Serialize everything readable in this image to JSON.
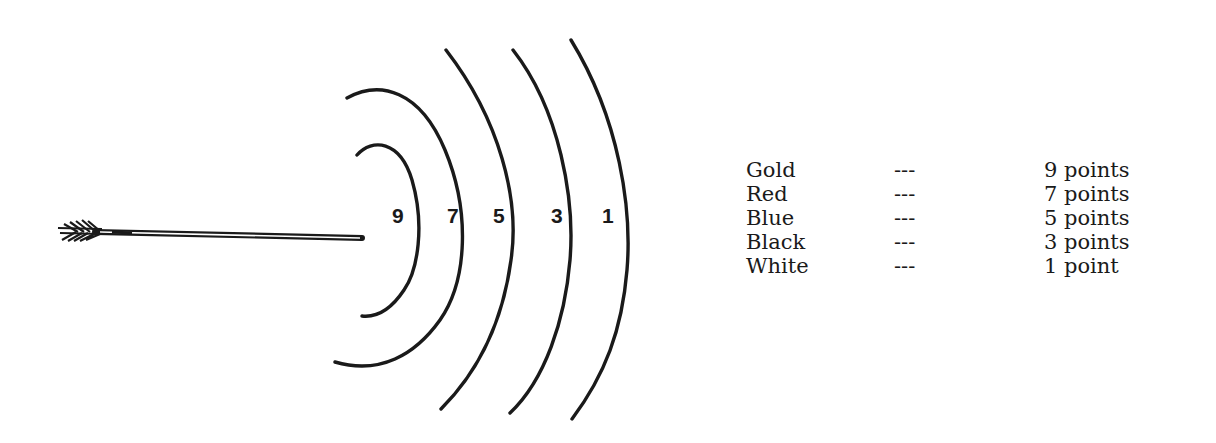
{
  "diagram": {
    "arrow": {
      "icon": "arrow-icon"
    },
    "rings": [
      {
        "label": "9",
        "x": 398,
        "y": 219
      },
      {
        "label": "7",
        "x": 454,
        "y": 219
      },
      {
        "label": "5",
        "x": 500,
        "y": 219
      },
      {
        "label": "3",
        "x": 558,
        "y": 219
      },
      {
        "label": "1",
        "x": 610,
        "y": 219
      }
    ],
    "ink_color": "#1a1a1a"
  },
  "legend": {
    "rows": [
      {
        "color": "Gold",
        "separator": "---",
        "points": "9 points"
      },
      {
        "color": "Red",
        "separator": "---",
        "points": "7 points"
      },
      {
        "color": "Blue",
        "separator": "---",
        "points": "5 points"
      },
      {
        "color": "Black",
        "separator": "---",
        "points": "3 points"
      },
      {
        "color": "White",
        "separator": "---",
        "points": "1 point"
      }
    ]
  }
}
